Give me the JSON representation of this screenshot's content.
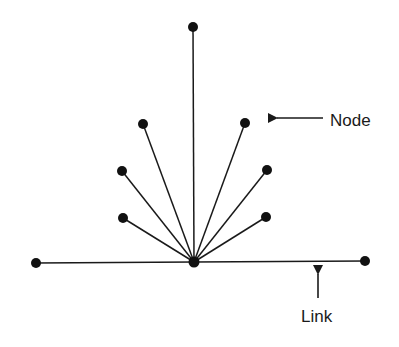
{
  "diagram": {
    "type": "star-network",
    "colors": {
      "background": "#ffffff",
      "stroke": "#1a1a1a",
      "node": "#111111"
    },
    "hub": {
      "id": "hub",
      "x": 194,
      "y": 262
    },
    "nodes": [
      {
        "id": "n-top",
        "x": 193,
        "y": 27
      },
      {
        "id": "n-upper-left",
        "x": 143,
        "y": 124
      },
      {
        "id": "n-upper-right",
        "x": 245,
        "y": 123
      },
      {
        "id": "n-mid-left",
        "x": 122,
        "y": 171
      },
      {
        "id": "n-mid-right",
        "x": 267,
        "y": 170
      },
      {
        "id": "n-lower-left",
        "x": 123,
        "y": 218
      },
      {
        "id": "n-lower-right",
        "x": 266,
        "y": 217
      },
      {
        "id": "n-far-left",
        "x": 36,
        "y": 263
      },
      {
        "id": "n-far-right",
        "x": 365,
        "y": 261
      }
    ],
    "annotations": {
      "node": {
        "label": "Node",
        "text_x": 330,
        "text_y": 126,
        "arrow": {
          "x1": 323,
          "y1": 118,
          "x2": 268,
          "y2": 118
        }
      },
      "link": {
        "label": "Link",
        "text_x": 301,
        "text_y": 322,
        "arrow": {
          "x1": 318,
          "y1": 298,
          "x2": 318,
          "y2": 265
        }
      }
    }
  }
}
